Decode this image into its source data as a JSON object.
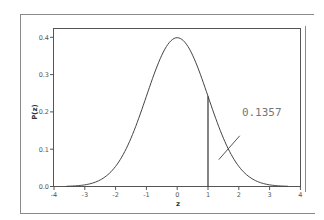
{
  "chart_data": {
    "type": "line",
    "title": "",
    "xlabel": "z",
    "ylabel": "P(z)",
    "xlim": [
      -4,
      4
    ],
    "ylim": [
      0,
      0.42
    ],
    "x_ticks": [
      "-4",
      "-3",
      "-2",
      "-1",
      "0",
      "1",
      "2",
      "3",
      "4"
    ],
    "y_ticks": [
      "0.0",
      "0.1",
      "0.2",
      "0.3",
      "0.4"
    ],
    "grid": false,
    "legend": null,
    "series": [
      {
        "name": "standard normal density",
        "mean": 0,
        "sd": 1,
        "x": [
          -4,
          -3.5,
          -3,
          -2.5,
          -2,
          -1.5,
          -1,
          -0.5,
          0,
          0.5,
          1,
          1.5,
          2,
          2.5,
          3,
          3.5,
          4
        ],
        "y": [
          0.0001,
          0.0009,
          0.0044,
          0.0175,
          0.054,
          0.1295,
          0.242,
          0.3521,
          0.3989,
          0.3521,
          0.242,
          0.1295,
          0.054,
          0.0175,
          0.0044,
          0.0009,
          0.0001
        ]
      }
    ],
    "annotations": [
      {
        "type": "vline",
        "x": 1,
        "y_from": 0,
        "y_to": 0.242
      },
      {
        "type": "text",
        "text": "0.1357",
        "x": 2.1,
        "y": 0.19,
        "meaning": "upper-tail area region marker"
      },
      {
        "type": "pointer",
        "from": [
          1.35,
          0.072
        ],
        "to": [
          2.03,
          0.136
        ]
      }
    ]
  }
}
